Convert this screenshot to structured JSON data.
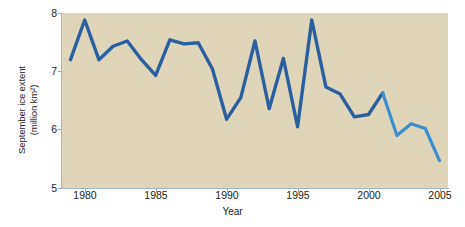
{
  "chart_data": {
    "type": "line",
    "title": "",
    "xlabel": "Year",
    "ylabel": "September ice extent (million km²)",
    "ylabel_line1": "September ice extent",
    "ylabel_line2": "(million km²)",
    "xlim": [
      1978.4,
      2005.6
    ],
    "ylim": [
      5,
      8
    ],
    "xticks": [
      1980,
      1985,
      1990,
      1995,
      2000,
      2005
    ],
    "xtick_labels": [
      "1980",
      "1985",
      "1990",
      "1995",
      "2000",
      "2005"
    ],
    "yticks": [
      5,
      6,
      7,
      8
    ],
    "ytick_labels": [
      "5",
      "6",
      "7",
      "8"
    ],
    "grid": false,
    "legend": "none",
    "series": [
      {
        "name": "September Arctic sea ice extent",
        "color_early": "#2b5f9e",
        "color_late": "#3d8ecb",
        "x": [
          1979,
          1980,
          1981,
          1982,
          1983,
          1984,
          1985,
          1986,
          1987,
          1988,
          1989,
          1990,
          1991,
          1992,
          1993,
          1994,
          1995,
          1996,
          1997,
          1998,
          1999,
          2000,
          2001,
          2002,
          2003,
          2004,
          2005
        ],
        "values": [
          7.2,
          7.88,
          7.2,
          7.43,
          7.52,
          7.2,
          6.93,
          7.54,
          7.47,
          7.49,
          7.04,
          6.18,
          6.55,
          7.52,
          6.36,
          7.22,
          6.05,
          7.88,
          6.73,
          6.61,
          6.22,
          6.26,
          6.63,
          5.9,
          6.1,
          6.02,
          5.47
        ]
      }
    ],
    "colors": {
      "plot_background": "#ded5ba",
      "page_background": "#ffffff",
      "axis": "#9fb6c4",
      "text": "#1c1c1c",
      "line_dark_blue": "#2b5f9e",
      "line_light_blue": "#3d8ecb"
    }
  }
}
